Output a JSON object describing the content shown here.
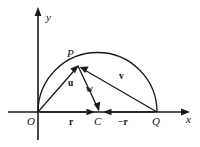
{
  "figure": {
    "type": "vector-diagram",
    "background_color": "#ffffff",
    "stroke_color": "#1a1a1a",
    "axes": {
      "x_label": "x",
      "y_label": "y"
    },
    "points": [
      {
        "id": "O",
        "label": "O",
        "x": 38,
        "y": 112
      },
      {
        "id": "P",
        "label": "P",
        "x": 78,
        "y": 66
      },
      {
        "id": "C",
        "label": "C",
        "x": 98,
        "y": 112
      },
      {
        "id": "Q",
        "label": "Q",
        "x": 157,
        "y": 112
      }
    ],
    "vectors": [
      {
        "id": "u",
        "label": "u",
        "from": "O",
        "to": "P"
      },
      {
        "id": "w",
        "label": "w",
        "from": "P",
        "to": "C"
      },
      {
        "id": "v",
        "label": "v",
        "from": "Q",
        "to": "P"
      },
      {
        "id": "r",
        "label": "r",
        "from": "O",
        "to": "C"
      },
      {
        "id": "minus-r",
        "label": "−r",
        "from": "Q",
        "to": "C"
      }
    ],
    "arc": {
      "id": "semicircle",
      "center": "C",
      "radius": 59.5,
      "from": "O",
      "to": "Q"
    }
  }
}
